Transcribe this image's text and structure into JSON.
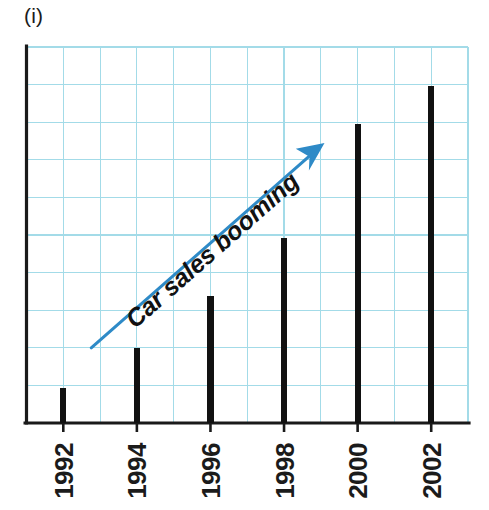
{
  "figure": {
    "label": "(i)"
  },
  "colors": {
    "grid": "#a3dbe8",
    "axis": "#1a1a1a",
    "bar": "#111111",
    "arrow": "#2e8ac7",
    "annotation_text": "#111111",
    "background": "#ffffff"
  },
  "annotation": {
    "text": "Car sales booming",
    "icon": "arrow-up-right-icon"
  },
  "axes": {
    "x_tick_labels": [
      "1992",
      "1994",
      "1996",
      "1998",
      "2000",
      "2002"
    ],
    "y_tick_labels": [],
    "grid_visible": true,
    "grid_columns": 12,
    "grid_rows": 10
  },
  "chart_data": {
    "type": "bar",
    "title": "",
    "subtitle": "",
    "xlabel": "",
    "ylabel": "",
    "categories": [
      "1992",
      "1994",
      "1996",
      "1998",
      "2000",
      "2002"
    ],
    "values": [
      0.93,
      2.0,
      3.38,
      4.93,
      7.96,
      8.97
    ],
    "ylim": [
      0,
      10
    ],
    "xlim": [
      0,
      12
    ],
    "grid": true,
    "legend_position": "none",
    "annotations": [
      {
        "text": "Car sales booming",
        "type": "arrow",
        "color": "#2e8ac7",
        "from": [
          1.76,
          2.0
        ],
        "to": [
          8.1,
          7.45
        ]
      }
    ]
  }
}
